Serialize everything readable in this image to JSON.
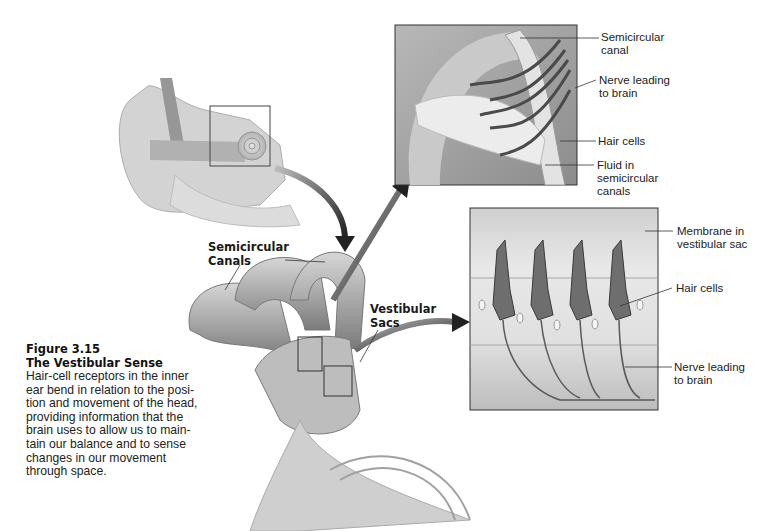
{
  "figure": {
    "number": "Figure 3.15",
    "title": "The Vestibular Sense",
    "caption": "Hair-cell receptors in the inner ear bend in relation to the posi-tion and movement of the head, providing information that the brain uses to allow us to main-tain our balance and to sense changes in our movement through space.",
    "caption_lines": [
      "Hair-cell receptors in the inner",
      "ear bend in relation to the posi-",
      "tion and movement of the head,",
      "providing information that the",
      "brain uses to allow us to main-",
      "tain our balance and to sense",
      "changes in our movement",
      "through space."
    ]
  },
  "main_labels": {
    "semicircular_canals": "Semicircular\nCanals",
    "vestibular_sacs": "Vestibular\nSacs"
  },
  "top_inset_labels": {
    "semicircular_canal": "Semicircular\ncanal",
    "nerve": "Nerve leading\nto brain",
    "hair_cells": "Hair cells",
    "fluid": "Fluid in\nsemicircular\ncanals"
  },
  "bottom_inset_labels": {
    "membrane": "Membrane in\nvestibular sac",
    "hair_cells": "Hair cells",
    "nerve": "Nerve leading\nto brain"
  },
  "colors": {
    "background": "#ffffff",
    "illustration_gray": "#9a9a9a",
    "arrow": "#2b2b2b"
  }
}
